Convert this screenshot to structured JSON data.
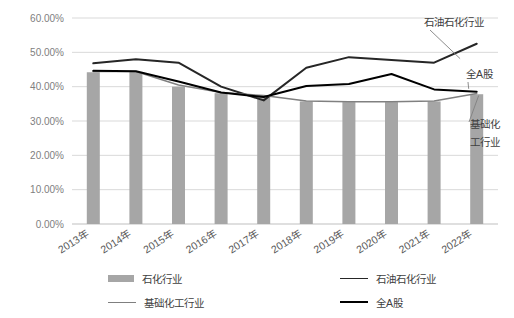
{
  "chart_data": {
    "type": "line",
    "title": "",
    "xlabel": "",
    "ylabel": "",
    "ylim": [
      0,
      0.6
    ],
    "grid": true,
    "legend_position": "bottom",
    "categories": [
      "2013年",
      "2014年",
      "2015年",
      "2016年",
      "2017年",
      "2018年",
      "2019年",
      "2020年",
      "2021年",
      "2022年"
    ],
    "ytick_labels": [
      "60.00%",
      "50.00%",
      "40.00%",
      "30.00%",
      "20.00%",
      "10.00%",
      "0.00%"
    ],
    "ytick_values": [
      0.6,
      0.5,
      0.4,
      0.3,
      0.2,
      0.1,
      0.0
    ],
    "series": [
      {
        "name": "石化行业",
        "type": "bar",
        "color": "#a6a6a6",
        "values": [
          0.442,
          0.443,
          0.4,
          0.381,
          0.372,
          0.357,
          0.355,
          0.355,
          0.357,
          0.378
        ]
      },
      {
        "name": "石油石化行业",
        "type": "line",
        "color": "#262626",
        "values": [
          0.468,
          0.48,
          0.47,
          0.4,
          0.36,
          0.455,
          0.486,
          0.478,
          0.47,
          0.525
        ]
      },
      {
        "name": "基础化工行业",
        "type": "line",
        "color": "#808080",
        "values": [
          0.444,
          0.444,
          0.405,
          0.383,
          0.374,
          0.358,
          0.356,
          0.356,
          0.358,
          0.38
        ]
      },
      {
        "name": "全A股",
        "type": "line",
        "color": "#000000",
        "values": [
          0.446,
          0.445,
          0.415,
          0.383,
          0.37,
          0.402,
          0.408,
          0.437,
          0.392,
          0.385
        ]
      }
    ],
    "annotations": [
      {
        "text": "石油石化行业",
        "target_series": "石油石化行业"
      },
      {
        "text": "全A股",
        "target_series": "全A股"
      },
      {
        "text": "基础化\n工行业",
        "target_series": "基础化工行业"
      }
    ]
  },
  "annotation_labels": {
    "petro": "石油石化行业",
    "all_a": "全A股",
    "basic_line1": "基础化",
    "basic_line2": "工行业"
  },
  "legend": {
    "items": [
      {
        "label": "石化行业",
        "marker": "bar"
      },
      {
        "label": "石油石化行业",
        "marker": "line-dark"
      },
      {
        "label": "基础化工行业",
        "marker": "line-gray"
      },
      {
        "label": "全A股",
        "marker": "line-black"
      }
    ]
  }
}
